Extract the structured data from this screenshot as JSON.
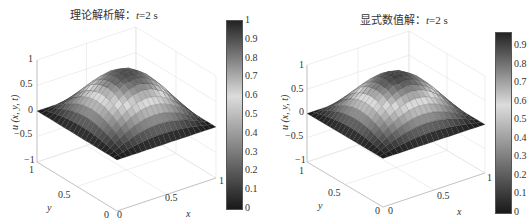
{
  "figure": {
    "panels": [
      {
        "title_prefix": "理论解析解：",
        "title_var": "t",
        "title_suffix": "=2 s",
        "zlabel": "u (x, y, t)",
        "xlabel": "x",
        "ylabel": "y",
        "ztick_labels": [
          "1",
          "0.5",
          "0",
          "−0.5",
          "−1"
        ],
        "xtick_labels": [
          "0",
          "0.5",
          "1"
        ],
        "ytick_labels": [
          "0",
          "0.5",
          "1"
        ],
        "colorbar_ticks": [
          "1",
          "0.9",
          "0.8",
          "0.7",
          "0.6",
          "0.5",
          "0.4",
          "0.3",
          "0.2",
          "0.1",
          "0"
        ]
      },
      {
        "title_prefix": "显式数值解：",
        "title_var": "t",
        "title_suffix": "=2 s",
        "zlabel": "u (x, y, t)",
        "xlabel": "x",
        "ylabel": "y",
        "ztick_labels": [
          "1",
          "0.5",
          "0",
          "−0.5",
          "−1"
        ],
        "xtick_labels": [
          "0",
          "0.5",
          "1"
        ],
        "ytick_labels": [
          "0",
          "0.5",
          "1"
        ],
        "colorbar_ticks": [
          "0.9",
          "0.8",
          "0.7",
          "0.6",
          "0.5",
          "0.4",
          "0.3",
          "0.2",
          "0.1",
          "0"
        ]
      }
    ]
  },
  "chart_data": [
    {
      "type": "surface",
      "title": "理论解析解：t=2 s",
      "xlabel": "x",
      "ylabel": "y",
      "zlabel": "u(x, y, t)",
      "xlim": [
        0,
        1
      ],
      "ylim": [
        0,
        1
      ],
      "zlim": [
        -1,
        1
      ],
      "clim": [
        0,
        1
      ],
      "colormap": "gray-diverging (dark at 0 and 1, light near 0.6)",
      "colorbar": true,
      "grid": true,
      "x": [
        0,
        0.1,
        0.2,
        0.3,
        0.4,
        0.5,
        0.6,
        0.7,
        0.8,
        0.9,
        1
      ],
      "y": [
        0,
        0.1,
        0.2,
        0.3,
        0.4,
        0.5,
        0.6,
        0.7,
        0.8,
        0.9,
        1
      ],
      "peak": 0.93,
      "z": [
        [
          0,
          0,
          0,
          0,
          0,
          0,
          0,
          0,
          0,
          0,
          0
        ],
        [
          0,
          0.089,
          0.169,
          0.232,
          0.273,
          0.287,
          0.273,
          0.232,
          0.169,
          0.089,
          0
        ],
        [
          0,
          0.169,
          0.322,
          0.442,
          0.52,
          0.547,
          0.52,
          0.442,
          0.322,
          0.169,
          0
        ],
        [
          0,
          0.232,
          0.442,
          0.609,
          0.715,
          0.752,
          0.715,
          0.609,
          0.442,
          0.232,
          0
        ],
        [
          0,
          0.273,
          0.52,
          0.715,
          0.841,
          0.884,
          0.841,
          0.715,
          0.52,
          0.273,
          0
        ],
        [
          0,
          0.287,
          0.547,
          0.752,
          0.884,
          0.93,
          0.884,
          0.752,
          0.547,
          0.287,
          0
        ],
        [
          0,
          0.273,
          0.52,
          0.715,
          0.841,
          0.884,
          0.841,
          0.715,
          0.52,
          0.273,
          0
        ],
        [
          0,
          0.232,
          0.442,
          0.609,
          0.715,
          0.752,
          0.715,
          0.609,
          0.442,
          0.232,
          0
        ],
        [
          0,
          0.169,
          0.322,
          0.442,
          0.52,
          0.547,
          0.52,
          0.442,
          0.322,
          0.169,
          0
        ],
        [
          0,
          0.089,
          0.169,
          0.232,
          0.273,
          0.287,
          0.273,
          0.232,
          0.169,
          0.089,
          0
        ],
        [
          0,
          0,
          0,
          0,
          0,
          0,
          0,
          0,
          0,
          0,
          0
        ]
      ]
    },
    {
      "type": "surface",
      "title": "显式数值解：t=2 s",
      "xlabel": "x",
      "ylabel": "y",
      "zlabel": "u(x, y, t)",
      "xlim": [
        0,
        1
      ],
      "ylim": [
        0,
        1
      ],
      "zlim": [
        -1,
        1
      ],
      "clim": [
        0,
        0.97
      ],
      "colormap": "gray-diverging (dark at 0 and max, light near 0.6)",
      "colorbar": true,
      "grid": true,
      "x": [
        0,
        0.1,
        0.2,
        0.3,
        0.4,
        0.5,
        0.6,
        0.7,
        0.8,
        0.9,
        1
      ],
      "y": [
        0,
        0.1,
        0.2,
        0.3,
        0.4,
        0.5,
        0.6,
        0.7,
        0.8,
        0.9,
        1
      ],
      "peak": 0.93,
      "z": [
        [
          0,
          0,
          0,
          0,
          0,
          0,
          0,
          0,
          0,
          0,
          0
        ],
        [
          0,
          0.089,
          0.169,
          0.232,
          0.273,
          0.287,
          0.273,
          0.232,
          0.169,
          0.089,
          0
        ],
        [
          0,
          0.169,
          0.322,
          0.442,
          0.52,
          0.547,
          0.52,
          0.442,
          0.322,
          0.169,
          0
        ],
        [
          0,
          0.232,
          0.442,
          0.609,
          0.715,
          0.752,
          0.715,
          0.609,
          0.442,
          0.232,
          0
        ],
        [
          0,
          0.273,
          0.52,
          0.715,
          0.841,
          0.884,
          0.841,
          0.715,
          0.52,
          0.273,
          0
        ],
        [
          0,
          0.287,
          0.547,
          0.752,
          0.884,
          0.93,
          0.884,
          0.752,
          0.547,
          0.287,
          0
        ],
        [
          0,
          0.273,
          0.52,
          0.715,
          0.841,
          0.884,
          0.841,
          0.715,
          0.52,
          0.273,
          0
        ],
        [
          0,
          0.232,
          0.442,
          0.609,
          0.715,
          0.752,
          0.715,
          0.609,
          0.442,
          0.232,
          0
        ],
        [
          0,
          0.169,
          0.322,
          0.442,
          0.52,
          0.547,
          0.52,
          0.442,
          0.322,
          0.169,
          0
        ],
        [
          0,
          0.089,
          0.169,
          0.232,
          0.273,
          0.287,
          0.273,
          0.232,
          0.169,
          0.089,
          0
        ],
        [
          0,
          0,
          0,
          0,
          0,
          0,
          0,
          0,
          0,
          0,
          0
        ]
      ]
    }
  ]
}
